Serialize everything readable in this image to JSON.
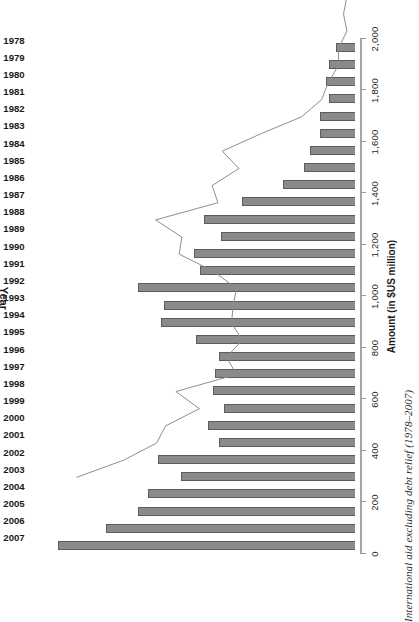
{
  "caption": "International aid excluding debt relief (1978–2007)",
  "axes": {
    "category_title": "Year",
    "value_title": "Amount (in $US million)",
    "value_ticks": [
      "0",
      "200",
      "400",
      "600",
      "800",
      "1,000",
      "1,200",
      "1,400",
      "1,600",
      "1,800",
      "2,000"
    ]
  },
  "style": {
    "bar_fill": "#8a8a8a",
    "bar_edge": "#5d5d5d",
    "axis_color": "#9a9a9a",
    "line_color": "#8e8e8e",
    "background": "#ffffff"
  },
  "chart_data": {
    "type": "bar",
    "title": "International aid excluding debt relief (1978–2007)",
    "xlabel": "Year",
    "ylabel": "Amount (in $US million)",
    "ylim": [
      0,
      2000
    ],
    "grid": false,
    "legend": null,
    "orientation": "vertical-rotated-90ccw",
    "categories": [
      "2007",
      "2006",
      "2005",
      "2004",
      "2003",
      "2002",
      "2001",
      "2000",
      "1999",
      "1998",
      "1997",
      "1996",
      "1995",
      "1994",
      "1993",
      "1992",
      "1991",
      "1990",
      "1989",
      "1988",
      "1987",
      "1986",
      "1985",
      "1984",
      "1983",
      "1982",
      "1981",
      "1980",
      "1979",
      "1978"
    ],
    "values": [
      1760,
      1480,
      1285,
      1230,
      1030,
      1170,
      810,
      870,
      775,
      840,
      830,
      810,
      945,
      1150,
      1135,
      1290,
      920,
      955,
      795,
      895,
      670,
      425,
      305,
      265,
      205,
      205,
      155,
      175,
      155,
      115
    ],
    "annotations": [
      {
        "text": "connecting line traces bar tops",
        "visible": true
      }
    ]
  }
}
